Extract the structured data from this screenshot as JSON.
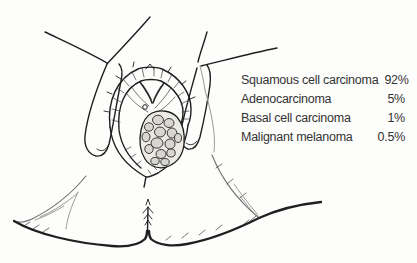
{
  "figure": {
    "colors": {
      "background": "#fdfdfc",
      "ink": "#1f1f1f",
      "faint": "#9a9a98",
      "crease": "#6f6f6f",
      "tumor_fill": "#d7d6d0",
      "tumor_bed": "#eceae5",
      "text": "#333333"
    }
  },
  "stats": {
    "rows": [
      {
        "label": "Squamous cell carcinoma",
        "value": "92%"
      },
      {
        "label": "Adenocarcinoma",
        "value": "5%"
      },
      {
        "label": "Basal cell carcinoma",
        "value": "1%"
      },
      {
        "label": "Malignant melanoma",
        "value": "0.5%"
      }
    ]
  }
}
